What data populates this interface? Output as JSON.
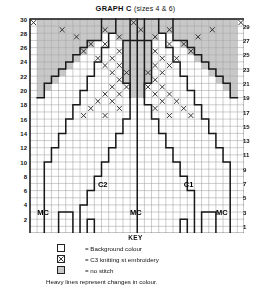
{
  "title": {
    "main": "GRAPH C",
    "sizes": "(sizes 4 & 6)"
  },
  "axes": {
    "left_labels": [
      30,
      28,
      26,
      24,
      22,
      20,
      18,
      16,
      14,
      12,
      10,
      8,
      6,
      4,
      2
    ],
    "right_labels": [
      29,
      27,
      25,
      23,
      21,
      19,
      17,
      15,
      13,
      11,
      9,
      7,
      5,
      3,
      1
    ]
  },
  "region_labels": [
    {
      "text": "C2",
      "col": 10.5,
      "row": 7.5
    },
    {
      "text": "C1",
      "col": 22.5,
      "row": 7.5
    },
    {
      "text": "MC",
      "col": 2.0,
      "row": 3.5
    },
    {
      "text": "MC",
      "col": 15.0,
      "row": 3.5
    },
    {
      "text": "MC",
      "col": 27.0,
      "row": 3.5
    }
  ],
  "key": {
    "title": "KEY",
    "items": [
      {
        "symbol": "background-colour-swatch",
        "text": "= Background colour"
      },
      {
        "symbol": "c3-embroidery-swatch",
        "text": "= C3 knitting st embroidery"
      },
      {
        "symbol": "no-stitch-swatch",
        "text": "= no stitch"
      }
    ],
    "note": "Heavy lines represent changes in colour."
  },
  "colors": {
    "grid_line": "#9a9a9a",
    "heavy_line": "#1a1a1a",
    "no_stitch_fill": "#c8c8c8",
    "background_fill": "#ffffff",
    "text": "#111111"
  },
  "chart_data": {
    "type": "heatmap",
    "title": "GRAPH C (sizes 4 & 6)",
    "xlabel": "",
    "ylabel": "",
    "cols": 30,
    "rows": 30,
    "cell_px": 7.15,
    "grid": true,
    "legend_position": "bottom",
    "no_stitch_cells": [
      {
        "row": 30,
        "cols": [
          2,
          3,
          4,
          5,
          6,
          7,
          8,
          9,
          10,
          11,
          12,
          13,
          14,
          15,
          16,
          17,
          18,
          19,
          20,
          21,
          22,
          23,
          24,
          25,
          26,
          27,
          28,
          29
        ]
      },
      {
        "row": 29,
        "cols": [
          2,
          3,
          4,
          5,
          6,
          7,
          8,
          9,
          10,
          11,
          12,
          13,
          14,
          15,
          16,
          17,
          18,
          19,
          20,
          21,
          22,
          23,
          24,
          25,
          26,
          27,
          28,
          29
        ]
      },
      {
        "row": 28,
        "cols": [
          2,
          3,
          4,
          5,
          6,
          7,
          8,
          9,
          10,
          13,
          14,
          15,
          16,
          17,
          18,
          21,
          22,
          23,
          24,
          25,
          26,
          27,
          28,
          29
        ]
      },
      {
        "row": 27,
        "cols": [
          2,
          3,
          4,
          5,
          6,
          7,
          8,
          9,
          14,
          15,
          16,
          17,
          22,
          23,
          24,
          25,
          26,
          27,
          28,
          29
        ]
      },
      {
        "row": 26,
        "cols": [
          2,
          3,
          4,
          5,
          6,
          7,
          8,
          14,
          15,
          16,
          17,
          23,
          24,
          25,
          26,
          27,
          28,
          29
        ]
      },
      {
        "row": 25,
        "cols": [
          2,
          3,
          4,
          5,
          6,
          7,
          14,
          15,
          16,
          17,
          24,
          25,
          26,
          27,
          28,
          29
        ]
      },
      {
        "row": 24,
        "cols": [
          2,
          3,
          4,
          5,
          6,
          14,
          15,
          16,
          17,
          25,
          26,
          27,
          28,
          29
        ]
      },
      {
        "row": 23,
        "cols": [
          2,
          3,
          4,
          5,
          14,
          15,
          16,
          17,
          26,
          27,
          28,
          29
        ]
      },
      {
        "row": 22,
        "cols": [
          2,
          3,
          4,
          14,
          15,
          16,
          17,
          27,
          28,
          29
        ]
      },
      {
        "row": 21,
        "cols": [
          2,
          3,
          15,
          16,
          28,
          29
        ]
      },
      {
        "row": 20,
        "cols": [
          2,
          15,
          16,
          29
        ]
      }
    ],
    "cross_cells": [
      {
        "row": 30,
        "cols": [
          1,
          15,
          30
        ]
      },
      {
        "row": 29,
        "cols": [
          5,
          11,
          16,
          20,
          26
        ]
      },
      {
        "row": 28,
        "cols": [
          7,
          13,
          18,
          24
        ]
      },
      {
        "row": 27,
        "cols": [
          9,
          11,
          20,
          22
        ]
      },
      {
        "row": 26,
        "cols": [
          8,
          13,
          18,
          23
        ]
      },
      {
        "row": 25,
        "cols": [
          10,
          12,
          19,
          21
        ]
      },
      {
        "row": 24,
        "cols": [
          11,
          13,
          18,
          20
        ]
      },
      {
        "row": 23,
        "cols": [
          12,
          14,
          17,
          19
        ]
      },
      {
        "row": 22,
        "cols": [
          13,
          18
        ]
      },
      {
        "row": 21,
        "cols": [
          12,
          14,
          17,
          19
        ]
      },
      {
        "row": 20,
        "cols": [
          11,
          13,
          18,
          20
        ]
      },
      {
        "row": 19,
        "cols": [
          10,
          12,
          19,
          21
        ]
      },
      {
        "row": 18,
        "cols": [
          9,
          13,
          18,
          22
        ]
      },
      {
        "row": 17,
        "cols": [
          8,
          11,
          20,
          23
        ]
      }
    ],
    "color_regions": [
      {
        "name": "MC",
        "label_positions": [
          [
            2,
            3
          ],
          [
            15,
            3
          ],
          [
            27,
            3
          ]
        ]
      },
      {
        "name": "C2",
        "label_positions": [
          [
            10,
            7
          ]
        ]
      },
      {
        "name": "C1",
        "label_positions": [
          [
            22,
            7
          ]
        ]
      }
    ]
  }
}
